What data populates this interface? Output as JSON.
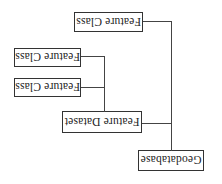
{
  "diagram": {
    "type": "tree",
    "orientation_note": "image rendered rotated 180 degrees",
    "root": {
      "label": "Geodatabase",
      "children": [
        {
          "label": "Feature Dataset",
          "children": [
            {
              "label": "Feature Class"
            },
            {
              "label": "Feature Class"
            }
          ]
        },
        {
          "label": "Feature Class"
        }
      ]
    }
  },
  "nodes": {
    "geodatabase": "Geodatabase",
    "feature_dataset": "Feature Dataset",
    "feature_class_1": "Feature Class",
    "feature_class_2": "Feature Class",
    "feature_class_3": "Feature Class"
  },
  "colors": {
    "border": "#333333",
    "line": "#444444",
    "text": "#222222",
    "background": "#ffffff"
  }
}
